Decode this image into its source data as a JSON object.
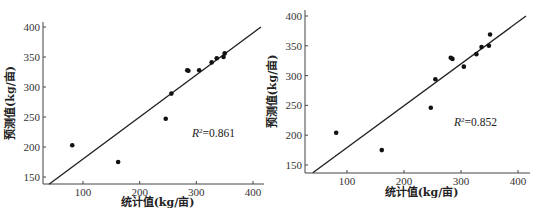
{
  "chart_data": [
    {
      "type": "scatter",
      "title": "",
      "xlabel": "统计值(kg/亩)",
      "ylabel": "预测值(kg/亩)",
      "xlim": [
        30,
        420
      ],
      "ylim": [
        138,
        405
      ],
      "xticks": [
        100,
        200,
        300,
        400
      ],
      "yticks": [
        150,
        200,
        250,
        300,
        350,
        400
      ],
      "grid": false,
      "annotation": {
        "prefix": "R",
        "sup": "2",
        "text": "=0.861"
      },
      "fit_line": {
        "x": [
          40,
          414
        ],
        "y": [
          138,
          400
        ]
      },
      "points": [
        {
          "x": 81,
          "y": 203
        },
        {
          "x": 162,
          "y": 175
        },
        {
          "x": 246,
          "y": 247
        },
        {
          "x": 256,
          "y": 289
        },
        {
          "x": 284,
          "y": 328
        },
        {
          "x": 286,
          "y": 327
        },
        {
          "x": 305,
          "y": 328
        },
        {
          "x": 327,
          "y": 341
        },
        {
          "x": 336,
          "y": 348
        },
        {
          "x": 348,
          "y": 350
        },
        {
          "x": 350,
          "y": 356
        }
      ]
    },
    {
      "type": "scatter",
      "title": "",
      "xlabel": "统计值(kg/亩)",
      "ylabel": "预测值(kg/亩)",
      "xlim": [
        30,
        420
      ],
      "ylim": [
        137,
        405
      ],
      "xticks": [
        100,
        200,
        300,
        400
      ],
      "yticks": [
        150,
        200,
        250,
        300,
        350,
        400
      ],
      "grid": false,
      "annotation": {
        "prefix": "R",
        "sup": "2",
        "text": "=0.852"
      },
      "fit_line": {
        "x": [
          40,
          414
        ],
        "y": [
          137,
          400
        ]
      },
      "points": [
        {
          "x": 81,
          "y": 204
        },
        {
          "x": 161,
          "y": 175
        },
        {
          "x": 247,
          "y": 246
        },
        {
          "x": 255,
          "y": 294
        },
        {
          "x": 282,
          "y": 330
        },
        {
          "x": 285,
          "y": 328
        },
        {
          "x": 305,
          "y": 315
        },
        {
          "x": 327,
          "y": 336
        },
        {
          "x": 336,
          "y": 348
        },
        {
          "x": 349,
          "y": 350
        },
        {
          "x": 351,
          "y": 369
        }
      ]
    }
  ]
}
